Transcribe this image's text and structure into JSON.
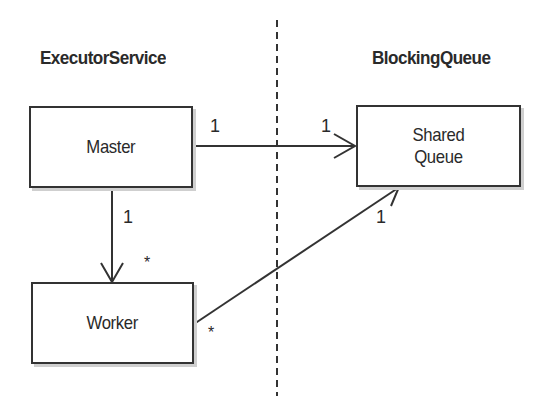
{
  "diagram": {
    "type": "uml-class-association",
    "separator": {
      "style": "dashed",
      "x": 277,
      "y_start": 20,
      "y_end": 395
    },
    "packages": [
      {
        "id": "executor-service",
        "label": "ExecutorService"
      },
      {
        "id": "blocking-queue",
        "label": "BlockingQueue"
      }
    ],
    "nodes": [
      {
        "id": "master",
        "label": "Master",
        "package": "ExecutorService"
      },
      {
        "id": "worker",
        "label": "Worker",
        "package": "ExecutorService"
      },
      {
        "id": "shared-queue",
        "label": "Shared\nQueue",
        "package": "BlockingQueue"
      }
    ],
    "edges": [
      {
        "from": "master",
        "to": "shared-queue",
        "arrow": "open",
        "from_multiplicity": "1",
        "to_multiplicity": "1"
      },
      {
        "from": "master",
        "to": "worker",
        "arrow": "open",
        "from_multiplicity": "1",
        "to_multiplicity": "*"
      },
      {
        "from": "worker",
        "to": "shared-queue",
        "arrow": "open",
        "from_multiplicity": "*",
        "to_multiplicity": "1"
      }
    ]
  },
  "labels": {
    "left_heading": "ExecutorService",
    "right_heading": "BlockingQueue",
    "master": "Master",
    "worker": "Worker",
    "shared_queue": "Shared\nQueue",
    "mult_master_queue_from": "1",
    "mult_master_queue_to": "1",
    "mult_master_worker_from": "1",
    "mult_master_worker_to": "*",
    "mult_worker_queue_from": "*",
    "mult_worker_queue_to": "1"
  },
  "colors": {
    "stroke": "#333333",
    "text": "#2a2a2a",
    "shadow": "#cfcfcf",
    "background": "#ffffff"
  }
}
